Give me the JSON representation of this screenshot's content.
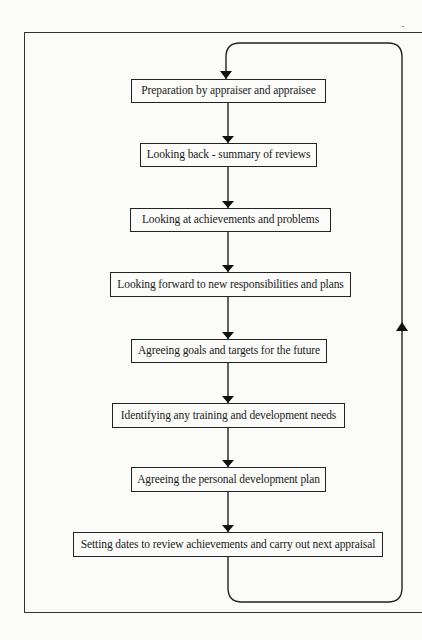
{
  "diagram": {
    "type": "cyclical flowchart",
    "steps": [
      {
        "id": 1,
        "label": "Preparation by appraiser and appraisee"
      },
      {
        "id": 2,
        "label": "Looking back - summary of reviews"
      },
      {
        "id": 3,
        "label": "Looking at achievements and problems"
      },
      {
        "id": 4,
        "label": "Looking forward to new responsibilities and plans"
      },
      {
        "id": 5,
        "label": "Agreeing goals and targets for the future"
      },
      {
        "id": 6,
        "label": "Identifying any training and development needs"
      },
      {
        "id": 7,
        "label": "Agreeing the personal development plan"
      },
      {
        "id": 8,
        "label": "Setting dates to review achievements and carry out next appraisal"
      }
    ],
    "connections": [
      {
        "from": 1,
        "to": 2
      },
      {
        "from": 2,
        "to": 3
      },
      {
        "from": 3,
        "to": 4
      },
      {
        "from": 4,
        "to": 5
      },
      {
        "from": 5,
        "to": 6
      },
      {
        "from": 6,
        "to": 7
      },
      {
        "from": 7,
        "to": 8
      },
      {
        "from": 8,
        "to": 1,
        "route": "loop back up the right side"
      }
    ],
    "colors": {
      "line": "#222222",
      "box_border": "#222222",
      "background": "#fbfbf9"
    }
  }
}
